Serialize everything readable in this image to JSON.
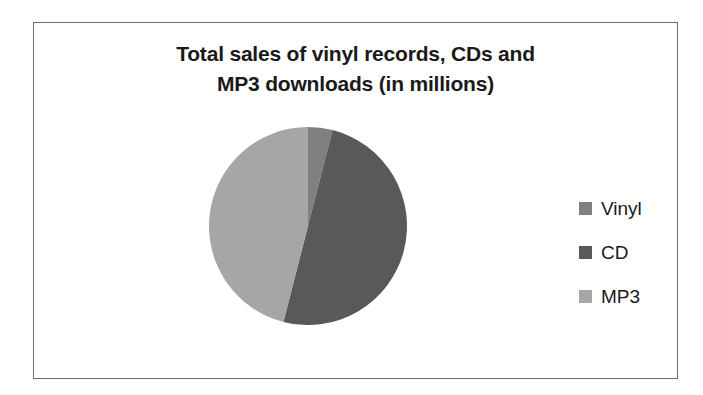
{
  "chart_data": {
    "type": "pie",
    "title": "Total sales of vinyl records, CDs and\nMP3 downloads (in millions)",
    "categories": [
      "Vinyl",
      "CD",
      "MP3"
    ],
    "values": [
      4,
      50,
      46
    ],
    "legend_position": "right",
    "grid": false,
    "colors": {
      "Vinyl": "#808080",
      "CD": "#595959",
      "MP3": "#a6a6a6"
    },
    "series": [
      {
        "name": "Total sales (in millions)",
        "values": [
          4,
          50,
          46
        ]
      }
    ],
    "slices": [
      {
        "label": "Vinyl",
        "value": 4,
        "start_angle": 0,
        "end_angle": 14.4,
        "color": "#808080"
      },
      {
        "label": "CD",
        "value": 50,
        "start_angle": 14.4,
        "end_angle": 194.4,
        "color": "#595959"
      },
      {
        "label": "MP3",
        "value": 46,
        "start_angle": 194.4,
        "end_angle": 360,
        "color": "#a6a6a6"
      }
    ]
  },
  "frame": {
    "border_color": "#6e6e6e",
    "background": "#ffffff"
  }
}
